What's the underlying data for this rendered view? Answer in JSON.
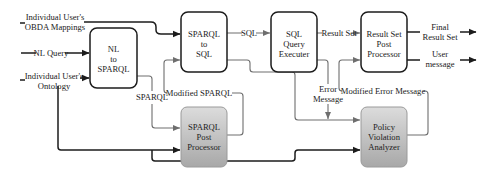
{
  "diagram": {
    "inputs": {
      "obda": [
        "Individual User's",
        "OBDA Mappings"
      ],
      "nl_query": "NL Query",
      "ontology": [
        "Individual User's",
        "Ontology"
      ]
    },
    "boxes": {
      "nl_to_sparql": [
        "NL",
        "to",
        "SPARQL"
      ],
      "sparql_to_sql": [
        "SPARQL",
        "to",
        "SQL"
      ],
      "sql_executer": [
        "SQL",
        "Query",
        "Executer"
      ],
      "result_post": [
        "Result Set",
        "Post",
        "Processor"
      ],
      "sparql_post": [
        "SPARQL",
        "Post",
        "Processor"
      ],
      "policy": [
        "Policy",
        "Violation",
        "Analyzer"
      ]
    },
    "edges": {
      "sql": "SQL",
      "result_set": "Result Set",
      "sparql": "SPARQL",
      "modified_sparql": "Modified SPARQL",
      "error_message": [
        "Error",
        "Message"
      ],
      "modified_error": "Modified Error Message"
    },
    "outputs": {
      "final_result": [
        "Final",
        "Result Set"
      ],
      "user_message": [
        "User",
        "message"
      ]
    },
    "colors": {
      "dark_line": "#1c1c1c",
      "gray_line": "#6e6e6e",
      "gray_box_top": "#dadada",
      "gray_box_bottom": "#a9a9a9"
    }
  }
}
